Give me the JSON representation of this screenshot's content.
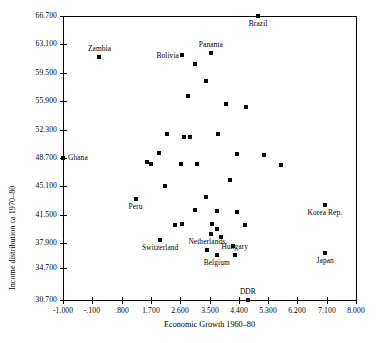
{
  "chart_data": {
    "type": "scatter",
    "title": "",
    "xlabel": "Economic Growth 1960–80",
    "ylabel": "Income distribution ca 1970–80",
    "xlim": [
      -1.0,
      8.0
    ],
    "ylim": [
      30.7,
      66.7
    ],
    "grid": false,
    "legend": "none",
    "xticks": [
      "-1.000",
      "-.100",
      ".800",
      "1.700",
      "2.600",
      "3.500",
      "4.400",
      "5.300",
      "6.200",
      "7.100",
      "8.000"
    ],
    "xtick_values": [
      -1.0,
      -0.1,
      0.8,
      1.7,
      2.6,
      3.5,
      4.4,
      5.3,
      6.2,
      7.1,
      8.0
    ],
    "yticks": [
      "66.700",
      "63.100",
      "59.500",
      "55.900",
      "52.300",
      "48.700",
      "45.100",
      "41.500",
      "37.900",
      "34.700",
      "30.700"
    ],
    "ytick_values": [
      66.7,
      63.1,
      59.5,
      55.9,
      52.3,
      48.7,
      45.1,
      41.5,
      37.9,
      34.7,
      30.7
    ],
    "marker": "filled-square",
    "marker_color": "#000000",
    "points": [
      {
        "label": "Brazil",
        "x": 5.0,
        "y": 66.7,
        "label_pos": "below"
      },
      {
        "label": "Zambia",
        "x": 0.12,
        "y": 61.45,
        "label_pos": "above"
      },
      {
        "label": "Panama",
        "x": 3.54,
        "y": 62.05,
        "label_pos": "above"
      },
      {
        "label": "Bolivia",
        "x": 2.67,
        "y": 61.7,
        "label_pos": "left"
      },
      {
        "label": "Ghana",
        "x": -1.0,
        "y": 48.7,
        "label_pos": "right"
      },
      {
        "label": "Peru",
        "x": 1.23,
        "y": 43.55,
        "label_pos": "below"
      },
      {
        "label": "Korea Rep.",
        "x": 7.05,
        "y": 42.75,
        "label_pos": "below"
      },
      {
        "label": "Switzerland",
        "x": 1.98,
        "y": 38.35,
        "label_pos": "below"
      },
      {
        "label": "Netherlands",
        "x": 3.42,
        "y": 37.05,
        "label_pos": "above"
      },
      {
        "label": "Belgium",
        "x": 3.72,
        "y": 36.4,
        "label_pos": "below"
      },
      {
        "label": "Hungary",
        "x": 4.28,
        "y": 36.4,
        "label_pos": "above"
      },
      {
        "label": "Japan",
        "x": 7.05,
        "y": 36.7,
        "label_pos": "below"
      },
      {
        "label": "DDR",
        "x": 4.68,
        "y": 30.7,
        "label_pos": "above"
      },
      {
        "label": "",
        "x": 3.06,
        "y": 60.6
      },
      {
        "label": "",
        "x": 3.38,
        "y": 58.4
      },
      {
        "label": "",
        "x": 2.83,
        "y": 56.55
      },
      {
        "label": "",
        "x": 4.01,
        "y": 55.55
      },
      {
        "label": "",
        "x": 4.62,
        "y": 55.2
      },
      {
        "label": "",
        "x": 2.18,
        "y": 51.8
      },
      {
        "label": "",
        "x": 2.73,
        "y": 51.4
      },
      {
        "label": "",
        "x": 2.9,
        "y": 51.4
      },
      {
        "label": "",
        "x": 3.77,
        "y": 51.75
      },
      {
        "label": "",
        "x": 1.96,
        "y": 49.3
      },
      {
        "label": "",
        "x": 4.36,
        "y": 49.25
      },
      {
        "label": "",
        "x": 5.17,
        "y": 49.05
      },
      {
        "label": "",
        "x": 1.7,
        "y": 47.95
      },
      {
        "label": "",
        "x": 2.61,
        "y": 48.0
      },
      {
        "label": "",
        "x": 3.11,
        "y": 47.95
      },
      {
        "label": "",
        "x": 5.7,
        "y": 47.75
      },
      {
        "label": "",
        "x": 1.58,
        "y": 48.15
      },
      {
        "label": "",
        "x": 2.13,
        "y": 45.1
      },
      {
        "label": "",
        "x": 4.14,
        "y": 45.9
      },
      {
        "label": "",
        "x": 3.4,
        "y": 43.7
      },
      {
        "label": "",
        "x": 3.04,
        "y": 42.15
      },
      {
        "label": "",
        "x": 3.73,
        "y": 42.0
      },
      {
        "label": "",
        "x": 4.34,
        "y": 41.8
      },
      {
        "label": "",
        "x": 2.45,
        "y": 40.2
      },
      {
        "label": "",
        "x": 2.66,
        "y": 40.3
      },
      {
        "label": "",
        "x": 3.58,
        "y": 40.3
      },
      {
        "label": "",
        "x": 3.72,
        "y": 39.65
      },
      {
        "label": "",
        "x": 3.56,
        "y": 39.05
      },
      {
        "label": "",
        "x": 3.85,
        "y": 38.65
      },
      {
        "label": "",
        "x": 4.6,
        "y": 40.2
      },
      {
        "label": "",
        "x": 4.22,
        "y": 37.6
      }
    ]
  },
  "plot_geometry": {
    "left": 63,
    "top": 16,
    "right": 356,
    "bottom": 300
  }
}
